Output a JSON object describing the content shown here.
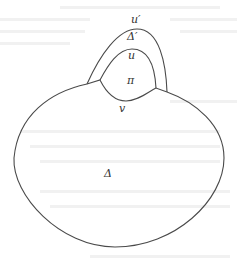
{
  "diagram": {
    "type": "region-diagram",
    "colors": {
      "stroke": "#4a4a4a",
      "label": "#333333",
      "background": "#ffffff"
    },
    "labels": {
      "outer_arch": "u′",
      "strip_region": "Δ′",
      "inner_arch": "u",
      "inner_region": "π",
      "lower_boundary": "v",
      "main_region": "Δ"
    },
    "nodes": [
      {
        "id": "main_region",
        "label": "Δ",
        "kind": "region"
      },
      {
        "id": "inner_region",
        "label": "π",
        "kind": "region"
      },
      {
        "id": "strip_region",
        "label": "Δ′",
        "kind": "region"
      },
      {
        "id": "outer_arch",
        "label": "u′",
        "kind": "path"
      },
      {
        "id": "inner_arch",
        "label": "u",
        "kind": "path"
      },
      {
        "id": "lower_boundary",
        "label": "v",
        "kind": "path"
      }
    ],
    "edges": [
      {
        "from": "strip_region",
        "to": "outer_arch",
        "relation": "bounded above by"
      },
      {
        "from": "strip_region",
        "to": "inner_arch",
        "relation": "bounded below by"
      },
      {
        "from": "inner_region",
        "to": "inner_arch",
        "relation": "bounded above by"
      },
      {
        "from": "inner_region",
        "to": "lower_boundary",
        "relation": "bounded below by"
      },
      {
        "from": "main_region",
        "to": "lower_boundary",
        "relation": "shares boundary"
      }
    ]
  }
}
